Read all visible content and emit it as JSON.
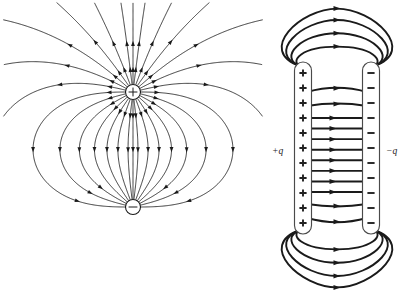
{
  "figure": {
    "name": "electric-field-line-figure",
    "background_color": "#ffffff",
    "line_color": "#1a1a1a",
    "width": 412,
    "height": 298,
    "panels": [
      {
        "id": "dipole",
        "name": "electric-dipole-panel",
        "description": "Electric field lines of an electric dipole",
        "charges": [
          {
            "name": "positive-charge",
            "sign": "+",
            "cx": 133,
            "cy": 92,
            "r": 7.5
          },
          {
            "name": "negative-charge",
            "sign": "−",
            "cx": 133,
            "cy": 207,
            "r": 7.5
          }
        ],
        "field_line_count": 26,
        "arrow_direction": "from positive charge to negative charge"
      },
      {
        "id": "capacitor",
        "name": "parallel-plate-capacitor-panel",
        "description": "Electric field lines between two oppositely charged parallel plates",
        "plates": [
          {
            "name": "positive-plate",
            "label": "+q",
            "sign": "+",
            "sign_count": 11,
            "x": 303,
            "y_top": 64,
            "y_bottom": 232
          },
          {
            "name": "negative-plate",
            "label": "−q",
            "sign": "−",
            "sign_count": 11,
            "x": 371,
            "y_top": 64,
            "y_bottom": 232
          }
        ],
        "labels": [
          {
            "name": "positive-charge-label",
            "text": "+q",
            "x": 281,
            "y": 151
          },
          {
            "name": "negative-charge-label",
            "text": "−q",
            "x": 389,
            "y": 151
          }
        ],
        "interior_straight_lines": 8,
        "fringe_arc_pairs": 6,
        "arrow_direction": "from positive plate to negative plate"
      }
    ]
  }
}
